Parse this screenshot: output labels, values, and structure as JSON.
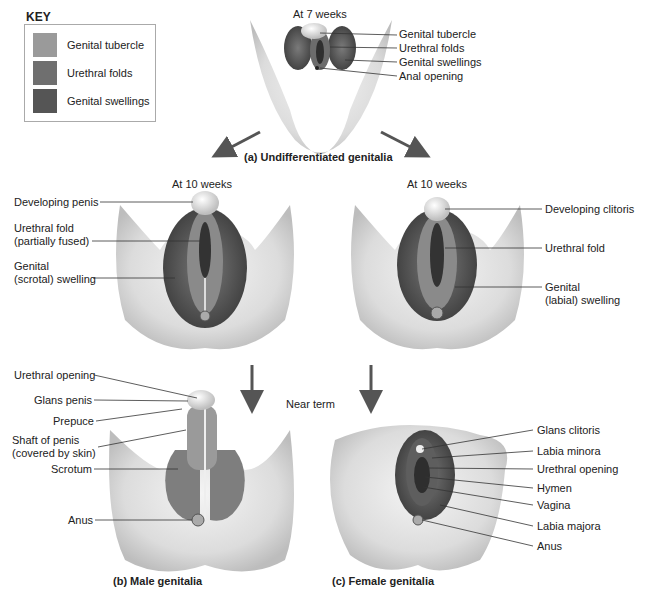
{
  "key": {
    "title": "KEY",
    "items": [
      {
        "label": "Genital tubercle",
        "color": "#9a9a9a"
      },
      {
        "label": "Urethral folds",
        "color": "#6f6f6f"
      },
      {
        "label": "Genital swellings",
        "color": "#555555"
      }
    ]
  },
  "panel_a": {
    "stage": "At 7 weeks",
    "caption": "(a)  Undifferentiated genitalia",
    "labels": [
      "Genital tubercle",
      "Urethral folds",
      "Genital swellings",
      "Anal opening"
    ]
  },
  "male_10wk": {
    "stage": "At 10 weeks",
    "labels": {
      "developing_penis": "Developing penis",
      "urethral_fold_1": "Urethral fold",
      "urethral_fold_2": "(partially fused)",
      "genital_swelling_1": "Genital",
      "genital_swelling_2": "(scrotal) swelling"
    }
  },
  "female_10wk": {
    "stage": "At 10 weeks",
    "labels": {
      "developing_clitoris": "Developing clitoris",
      "urethral_fold": "Urethral fold",
      "genital_swelling_1": "Genital",
      "genital_swelling_2": "(labial) swelling"
    }
  },
  "near_term": "Near term",
  "panel_b": {
    "caption": "(b)  Male genitalia",
    "labels": {
      "urethral_opening": "Urethral opening",
      "glans_penis": "Glans penis",
      "prepuce": "Prepuce",
      "shaft_1": "Shaft of penis",
      "shaft_2": "(covered by skin)",
      "scrotum": "Scrotum",
      "anus": "Anus"
    }
  },
  "panel_c": {
    "caption": "(c)  Female genitalia",
    "labels": [
      "Glans clitoris",
      "Labia minora",
      "Urethral opening",
      "Hymen",
      "Vagina",
      "Labia majora",
      "Anus"
    ]
  }
}
